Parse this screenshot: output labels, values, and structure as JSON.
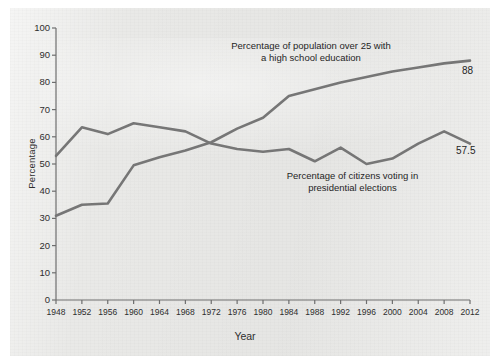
{
  "chart_data": {
    "type": "line",
    "title": "",
    "xlabel": "Year",
    "ylabel": "Percentage",
    "xlim": [
      1948,
      2012
    ],
    "ylim": [
      0,
      100
    ],
    "grid": false,
    "legend_position": "inline-annotations",
    "x": [
      1948,
      1952,
      1956,
      1960,
      1964,
      1968,
      1972,
      1976,
      1980,
      1984,
      1988,
      1992,
      1996,
      2000,
      2004,
      2008,
      2012
    ],
    "categories": [
      "1948",
      "1952",
      "1956",
      "1960",
      "1964",
      "1968",
      "1972",
      "1976",
      "1980",
      "1984",
      "1988",
      "1992",
      "1996",
      "2000",
      "2004",
      "2008",
      "2012"
    ],
    "ytick_labels": [
      "0",
      "10",
      "20",
      "30",
      "40",
      "50",
      "60",
      "70",
      "80",
      "90",
      "100"
    ],
    "ytick_values": [
      0,
      10,
      20,
      30,
      40,
      50,
      60,
      70,
      80,
      90,
      100
    ],
    "series": [
      {
        "name": "Percentage of population over 25 with a high school education",
        "values": [
          31,
          35,
          35.5,
          49.5,
          52.5,
          55,
          58,
          63,
          67,
          75,
          77.5,
          80,
          82,
          84,
          85.5,
          87,
          88
        ],
        "color": "#767676",
        "end_label": "88"
      },
      {
        "name": "Percentage of citizens voting in presidential elections",
        "values": [
          53,
          63.5,
          61,
          65,
          63.5,
          62,
          57.5,
          55.5,
          54.5,
          55.5,
          51,
          56,
          50,
          52,
          57.5,
          62,
          57.5
        ],
        "color": "#767676",
        "end_label": "57.5"
      }
    ],
    "annotations": [
      {
        "id": "education",
        "text": "Percentage of population over 25 with\na high school education"
      },
      {
        "id": "voting",
        "text": "Percentage of citizens voting in\npresidential elections"
      }
    ]
  },
  "axis": {
    "y_title": "Percentage",
    "x_title": "Year"
  },
  "colors": {
    "line": "#767676",
    "axis": "#6e6e6e",
    "text": "#1f1f1f",
    "panel": "#e9e9e7"
  }
}
